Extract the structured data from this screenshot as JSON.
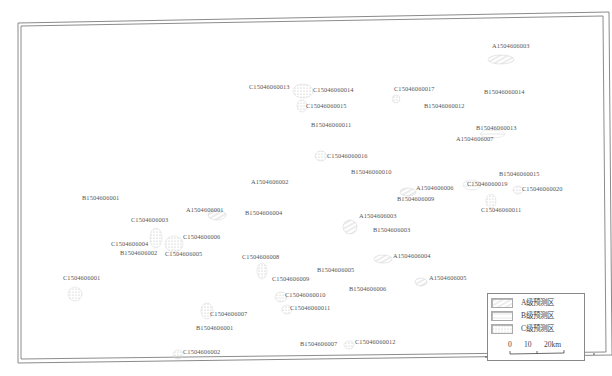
{
  "map": {
    "frame_color": "#777777",
    "zone_colors": {
      "A": "#cfcfcf",
      "B": "#dcdcdc",
      "C": "#d6d6d6"
    },
    "labels": [
      {
        "text": "A1504606003",
        "x": 492,
        "y": 47,
        "grade": "A"
      },
      {
        "text": "C15046060013",
        "x": 249,
        "y": 88,
        "grade": "C"
      },
      {
        "text": "C15046060014",
        "x": 313,
        "y": 91,
        "grade": "C"
      },
      {
        "text": "C15046060017",
        "x": 394,
        "y": 90,
        "grade": "C"
      },
      {
        "text": "B15046060014",
        "x": 484,
        "y": 93,
        "grade": "B"
      },
      {
        "text": "C15046060015",
        "x": 306,
        "y": 107,
        "grade": "C"
      },
      {
        "text": "B15046060012",
        "x": 424,
        "y": 107,
        "grade": "B"
      },
      {
        "text": "B15046060011",
        "x": 311,
        "y": 126,
        "grade": "B"
      },
      {
        "text": "B15046060013",
        "x": 476,
        "y": 129,
        "grade": "B"
      },
      {
        "text": "A1504606007",
        "x": 456,
        "y": 140,
        "grade": "A"
      },
      {
        "text": "C15046060016",
        "x": 327,
        "y": 157,
        "grade": "C"
      },
      {
        "text": "B15046060010",
        "x": 351,
        "y": 173,
        "grade": "B"
      },
      {
        "text": "B15046060015",
        "x": 499,
        "y": 175,
        "grade": "B"
      },
      {
        "text": "A1504606002",
        "x": 251,
        "y": 183,
        "grade": "A"
      },
      {
        "text": "C15046060019",
        "x": 467,
        "y": 185,
        "grade": "C"
      },
      {
        "text": "A1504606006",
        "x": 416,
        "y": 189,
        "grade": "A"
      },
      {
        "text": "C15046060020",
        "x": 522,
        "y": 190,
        "grade": "C"
      },
      {
        "text": "B1504606009",
        "x": 397,
        "y": 200,
        "grade": "B"
      },
      {
        "text": "B1504606001",
        "x": 82,
        "y": 199,
        "grade": "B"
      },
      {
        "text": "A1504606001",
        "x": 186,
        "y": 211,
        "grade": "A"
      },
      {
        "text": "B1504606004",
        "x": 245,
        "y": 214,
        "grade": "B"
      },
      {
        "text": "C15046060011",
        "x": 481,
        "y": 211,
        "grade": "C"
      },
      {
        "text": "A1504606003",
        "x": 359,
        "y": 217,
        "grade": "A"
      },
      {
        "text": "C1504606003",
        "x": 131,
        "y": 221,
        "grade": "C"
      },
      {
        "text": "B1504606003",
        "x": 373,
        "y": 231,
        "grade": "B"
      },
      {
        "text": "C1504606006",
        "x": 183,
        "y": 238,
        "grade": "C"
      },
      {
        "text": "C1504606004",
        "x": 111,
        "y": 245,
        "grade": "C"
      },
      {
        "text": "B1504606002",
        "x": 120,
        "y": 254,
        "grade": "B"
      },
      {
        "text": "C1504606005",
        "x": 165,
        "y": 255,
        "grade": "C"
      },
      {
        "text": "A1504606004",
        "x": 393,
        "y": 257,
        "grade": "A"
      },
      {
        "text": "C1504606008",
        "x": 242,
        "y": 258,
        "grade": "C"
      },
      {
        "text": "B1504606005",
        "x": 317,
        "y": 271,
        "grade": "B"
      },
      {
        "text": "C1504606001",
        "x": 63,
        "y": 279,
        "grade": "C"
      },
      {
        "text": "C1504606009",
        "x": 272,
        "y": 280,
        "grade": "C"
      },
      {
        "text": "A1504606005",
        "x": 429,
        "y": 279,
        "grade": "A"
      },
      {
        "text": "B1504606006",
        "x": 349,
        "y": 290,
        "grade": "B"
      },
      {
        "text": "C15046060010",
        "x": 285,
        "y": 296,
        "grade": "C"
      },
      {
        "text": "C15046060011",
        "x": 290,
        "y": 309,
        "grade": "C"
      },
      {
        "text": "C1504606007",
        "x": 210,
        "y": 315,
        "grade": "C"
      },
      {
        "text": "B1504606001",
        "x": 196,
        "y": 329,
        "grade": "B"
      },
      {
        "text": "B1504606007",
        "x": 300,
        "y": 345,
        "grade": "B"
      },
      {
        "text": "C15046060012",
        "x": 355,
        "y": 343,
        "grade": "C"
      },
      {
        "text": "C1504606002",
        "x": 183,
        "y": 353,
        "grade": "C"
      }
    ],
    "zones": [
      {
        "grade": "A",
        "x": 488,
        "y": 55,
        "w": 26,
        "h": 9
      },
      {
        "grade": "C",
        "x": 293,
        "y": 84,
        "w": 20,
        "h": 14
      },
      {
        "grade": "C",
        "x": 297,
        "y": 100,
        "w": 10,
        "h": 12
      },
      {
        "grade": "C",
        "x": 392,
        "y": 95,
        "w": 8,
        "h": 8
      },
      {
        "grade": "B",
        "x": 480,
        "y": 130,
        "w": 25,
        "h": 8
      },
      {
        "grade": "C",
        "x": 315,
        "y": 151,
        "w": 12,
        "h": 10
      },
      {
        "grade": "B",
        "x": 463,
        "y": 180,
        "w": 18,
        "h": 10
      },
      {
        "grade": "C",
        "x": 513,
        "y": 186,
        "w": 10,
        "h": 8
      },
      {
        "grade": "C",
        "x": 486,
        "y": 194,
        "w": 10,
        "h": 14
      },
      {
        "grade": "A",
        "x": 400,
        "y": 188,
        "w": 16,
        "h": 8
      },
      {
        "grade": "A",
        "x": 343,
        "y": 220,
        "w": 14,
        "h": 14
      },
      {
        "grade": "A",
        "x": 208,
        "y": 210,
        "w": 18,
        "h": 10
      },
      {
        "grade": "C",
        "x": 150,
        "y": 228,
        "w": 12,
        "h": 20
      },
      {
        "grade": "C",
        "x": 165,
        "y": 236,
        "w": 18,
        "h": 16
      },
      {
        "grade": "A",
        "x": 374,
        "y": 255,
        "w": 18,
        "h": 8
      },
      {
        "grade": "C",
        "x": 257,
        "y": 263,
        "w": 10,
        "h": 16
      },
      {
        "grade": "C",
        "x": 275,
        "y": 292,
        "w": 12,
        "h": 10
      },
      {
        "grade": "C",
        "x": 282,
        "y": 305,
        "w": 10,
        "h": 9
      },
      {
        "grade": "A",
        "x": 415,
        "y": 278,
        "w": 12,
        "h": 8
      },
      {
        "grade": "C",
        "x": 68,
        "y": 287,
        "w": 14,
        "h": 14
      },
      {
        "grade": "C",
        "x": 201,
        "y": 303,
        "w": 12,
        "h": 16
      },
      {
        "grade": "C",
        "x": 344,
        "y": 341,
        "w": 10,
        "h": 8
      },
      {
        "grade": "C",
        "x": 173,
        "y": 350,
        "w": 10,
        "h": 9
      }
    ]
  },
  "legend": {
    "items": [
      {
        "label": "A级预测区",
        "grade": "A"
      },
      {
        "label": "B级预测区",
        "grade": "B"
      },
      {
        "label": "C级预测区",
        "grade": "C"
      }
    ],
    "scale": {
      "ticks": [
        "0",
        "10",
        "20km"
      ]
    }
  }
}
